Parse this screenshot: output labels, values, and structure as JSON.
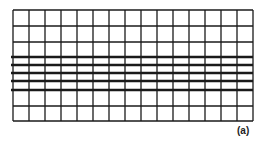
{
  "figure": {
    "label": "(a)",
    "grid": {
      "columns": 15,
      "rows": 8,
      "thick_horizontal_line_indices": [
        3,
        4,
        5,
        6,
        7
      ],
      "line_color": "#1a1a1a"
    }
  }
}
